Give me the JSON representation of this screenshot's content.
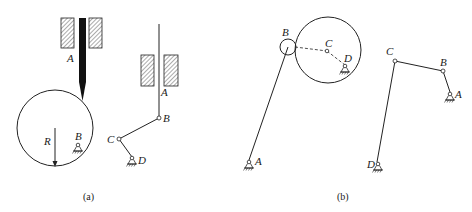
{
  "figure_a": {
    "caption": "(a)",
    "left_mechanism": {
      "labels": {
        "guide": "A",
        "radius": "R",
        "pivot": "B"
      }
    },
    "right_mechanism": {
      "labels": {
        "guide": "A",
        "joint_b": "B",
        "joint_c": "C",
        "pivot_d": "D"
      }
    }
  },
  "figure_b": {
    "caption": "(b)",
    "left_mechanism": {
      "labels": {
        "roller": "B",
        "center": "C",
        "pivot_d": "D",
        "pivot_a": "A"
      }
    },
    "right_mechanism": {
      "labels": {
        "joint_c": "C",
        "joint_b": "B",
        "pivot_a": "A",
        "pivot_d": "D"
      }
    }
  },
  "colors": {
    "stroke": "#222222",
    "background": "#ffffff"
  }
}
